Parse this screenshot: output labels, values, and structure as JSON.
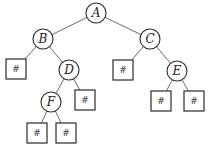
{
  "diagram": {
    "type": "binary-tree",
    "nodes": [
      {
        "id": "A",
        "label": "A",
        "shape": "circle",
        "cx": 96,
        "cy": 13
      },
      {
        "id": "B",
        "label": "B",
        "shape": "circle",
        "cx": 43,
        "cy": 39
      },
      {
        "id": "C",
        "label": "C",
        "shape": "circle",
        "cx": 150,
        "cy": 39
      },
      {
        "id": "D",
        "label": "D",
        "shape": "circle",
        "cx": 69,
        "cy": 70
      },
      {
        "id": "E",
        "label": "E",
        "shape": "circle",
        "cx": 177,
        "cy": 71
      },
      {
        "id": "F",
        "label": "F",
        "shape": "circle",
        "cx": 51,
        "cy": 102
      }
    ],
    "leaves": [
      {
        "id": "B_left",
        "label": "#",
        "shape": "square",
        "cx": 16,
        "cy": 69
      },
      {
        "id": "C_left",
        "label": "#",
        "shape": "square",
        "cx": 123,
        "cy": 70
      },
      {
        "id": "D_right",
        "label": "#",
        "shape": "square",
        "cx": 85,
        "cy": 100
      },
      {
        "id": "E_left",
        "label": "#",
        "shape": "square",
        "cx": 161,
        "cy": 101
      },
      {
        "id": "E_right",
        "label": "#",
        "shape": "square",
        "cx": 194,
        "cy": 101
      },
      {
        "id": "F_left",
        "label": "#",
        "shape": "square",
        "cx": 37,
        "cy": 133
      },
      {
        "id": "F_right",
        "label": "#",
        "shape": "square",
        "cx": 66,
        "cy": 133
      }
    ],
    "edges": [
      [
        "A",
        "B"
      ],
      [
        "A",
        "C"
      ],
      [
        "B",
        "B_left"
      ],
      [
        "B",
        "D"
      ],
      [
        "C",
        "C_left"
      ],
      [
        "C",
        "E"
      ],
      [
        "D",
        "F"
      ],
      [
        "D",
        "D_right"
      ],
      [
        "E",
        "E_left"
      ],
      [
        "E",
        "E_right"
      ],
      [
        "F",
        "F_left"
      ],
      [
        "F",
        "F_right"
      ]
    ]
  }
}
